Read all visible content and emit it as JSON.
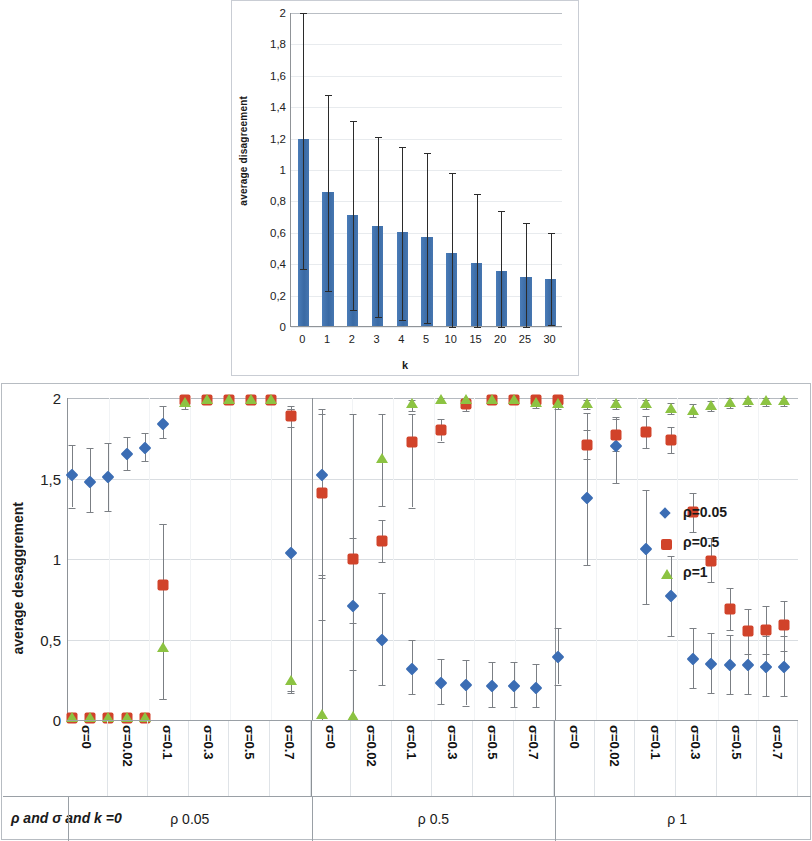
{
  "top": {
    "ylabel": "average disagreement",
    "xlabel": "k",
    "yticks": [
      "2",
      "1,8",
      "1,6",
      "1,4",
      "1,2",
      "1",
      "0,8",
      "0,6",
      "0,4",
      "0,2",
      "0"
    ]
  },
  "bottom": {
    "ylabel": "average desaggrement",
    "yticks": [
      "2",
      "1,5",
      "1",
      "0,5",
      "0"
    ],
    "footer_title": "ρ and σ and k =0",
    "legend": [
      {
        "label": "ρ=0.05",
        "marker": "diamond",
        "color": "#3b6db4"
      },
      {
        "label": "ρ=0.5",
        "marker": "square",
        "color": "#d1432a"
      },
      {
        "label": "ρ=1",
        "marker": "triangle",
        "color": "#8cc342"
      }
    ],
    "groups": [
      {
        "name": "ρ 0.05"
      },
      {
        "name": "ρ 0.5"
      },
      {
        "name": "ρ 1"
      }
    ],
    "sigma_labels": [
      "σ=0",
      "σ=0.02",
      "σ=0.1",
      "σ=0.3",
      "σ=0.5",
      "σ=0.7"
    ]
  },
  "chart_data": [
    {
      "type": "bar",
      "title": "",
      "xlabel": "k",
      "ylabel": "average disagreement",
      "ylim": [
        0,
        2
      ],
      "grid": true,
      "categories": [
        "0",
        "1",
        "2",
        "3",
        "4",
        "5",
        "10",
        "15",
        "20",
        "25",
        "30"
      ],
      "values": [
        1.19,
        0.855,
        0.71,
        0.64,
        0.6,
        0.57,
        0.465,
        0.4,
        0.35,
        0.315,
        0.3
      ],
      "error_low": [
        0.37,
        0.23,
        0.11,
        0.065,
        0.045,
        0.025,
        0.0,
        0.0,
        0.0,
        0.0,
        0.01
      ],
      "error_high": [
        2.0,
        1.48,
        1.31,
        1.21,
        1.15,
        1.11,
        0.98,
        0.85,
        0.74,
        0.66,
        0.6
      ],
      "bar_color": "#3d6fab",
      "error_color": "#2b2b2b"
    },
    {
      "type": "scatter",
      "title": "",
      "xlabel": "ρ and σ and k =0",
      "ylabel": "average desaggrement",
      "ylim": [
        0,
        2
      ],
      "grid": true,
      "legend_position": "right",
      "x_groups": [
        "ρ 0.05",
        "ρ 0.5",
        "ρ 1"
      ],
      "x": [
        "ρ 0.05 / σ=0",
        "ρ 0.05 / σ=0.02",
        "ρ 0.05 / σ=0.1",
        "ρ 0.05 / σ=0.3",
        "ρ 0.05 / σ=0.5",
        "ρ 0.05 / σ=0.7",
        "ρ 0.5 / σ=0",
        "ρ 0.5 / σ=0.02",
        "ρ 0.5 / σ=0.1",
        "ρ 0.5 / σ=0.3",
        "ρ 0.5 / σ=0.5",
        "ρ 0.5 / σ=0.7",
        "ρ 1 / σ=0",
        "ρ 1 / σ=0.02",
        "ρ 1 / σ=0.1",
        "ρ 1 / σ=0.3",
        "ρ 1 / σ=0.5",
        "ρ 1 / σ=0.7"
      ],
      "series": [
        {
          "name": "ρ=0.05",
          "marker": "diamond",
          "color": "#3b6db4",
          "points": [
            {
              "x": 0.1,
              "y": 1.52,
              "lo": 1.32,
              "hi": 1.71
            },
            {
              "x": 0.6,
              "y": 1.48,
              "lo": 1.29,
              "hi": 1.69
            },
            {
              "x": 1.1,
              "y": 1.51,
              "lo": 1.3,
              "hi": 1.72
            },
            {
              "x": 1.6,
              "y": 1.65,
              "lo": 1.55,
              "hi": 1.76
            },
            {
              "x": 2.1,
              "y": 1.69,
              "lo": 1.61,
              "hi": 1.78
            },
            {
              "x": 2.6,
              "y": 1.84,
              "lo": 1.75,
              "hi": 1.95
            },
            {
              "x": 6.1,
              "y": 1.04,
              "lo": 0.18,
              "hi": 1.93
            },
            {
              "x": 6.95,
              "y": 1.52,
              "lo": 0.88,
              "hi": 1.93
            },
            {
              "x": 7.8,
              "y": 0.71,
              "lo": 0.31,
              "hi": 1.13
            },
            {
              "x": 8.6,
              "y": 0.5,
              "lo": 0.22,
              "hi": 0.79
            },
            {
              "x": 9.4,
              "y": 0.32,
              "lo": 0.16,
              "hi": 0.5
            },
            {
              "x": 10.2,
              "y": 0.23,
              "lo": 0.1,
              "hi": 0.38
            },
            {
              "x": 10.9,
              "y": 0.22,
              "lo": 0.09,
              "hi": 0.37
            },
            {
              "x": 11.6,
              "y": 0.21,
              "lo": 0.08,
              "hi": 0.36
            },
            {
              "x": 12.2,
              "y": 0.21,
              "lo": 0.08,
              "hi": 0.36
            },
            {
              "x": 12.8,
              "y": 0.2,
              "lo": 0.08,
              "hi": 0.35
            },
            {
              "x": 13.4,
              "y": 0.39,
              "lo": 0.22,
              "hi": 0.57
            },
            {
              "x": 14.2,
              "y": 1.38,
              "lo": 0.96,
              "hi": 1.91
            },
            {
              "x": 15.0,
              "y": 1.7,
              "lo": 1.47,
              "hi": 1.88
            },
            {
              "x": 15.8,
              "y": 1.06,
              "lo": 0.72,
              "hi": 1.43
            },
            {
              "x": 16.5,
              "y": 0.77,
              "lo": 0.52,
              "hi": 1.02
            },
            {
              "x": 17.1,
              "y": 0.38,
              "lo": 0.2,
              "hi": 0.57
            },
            {
              "x": 17.6,
              "y": 0.35,
              "lo": 0.17,
              "hi": 0.54
            },
            {
              "x": 18.1,
              "y": 0.34,
              "lo": 0.16,
              "hi": 0.53
            },
            {
              "x": 18.6,
              "y": 0.34,
              "lo": 0.16,
              "hi": 0.53
            },
            {
              "x": 19.1,
              "y": 0.33,
              "lo": 0.15,
              "hi": 0.52
            },
            {
              "x": 19.6,
              "y": 0.33,
              "lo": 0.15,
              "hi": 0.52
            }
          ]
        },
        {
          "name": "ρ=0.5",
          "marker": "square",
          "color": "#d1432a",
          "points": [
            {
              "x": 0.1,
              "y": 0.01,
              "lo": 0.0,
              "hi": 0.02
            },
            {
              "x": 0.6,
              "y": 0.01,
              "lo": 0.0,
              "hi": 0.02
            },
            {
              "x": 1.1,
              "y": 0.01,
              "lo": 0.0,
              "hi": 0.02
            },
            {
              "x": 1.6,
              "y": 0.01,
              "lo": 0.0,
              "hi": 0.02
            },
            {
              "x": 2.1,
              "y": 0.01,
              "lo": 0.0,
              "hi": 0.02
            },
            {
              "x": 2.6,
              "y": 0.84,
              "lo": 0.13,
              "hi": 1.22
            },
            {
              "x": 3.2,
              "y": 1.99,
              "lo": 1.96,
              "hi": 2.0
            },
            {
              "x": 3.8,
              "y": 1.99,
              "lo": 1.96,
              "hi": 2.0
            },
            {
              "x": 4.4,
              "y": 1.99,
              "lo": 1.96,
              "hi": 2.0
            },
            {
              "x": 5.0,
              "y": 1.99,
              "lo": 1.96,
              "hi": 2.0
            },
            {
              "x": 5.55,
              "y": 1.99,
              "lo": 1.96,
              "hi": 2.0
            },
            {
              "x": 6.1,
              "y": 1.89,
              "lo": 1.82,
              "hi": 1.95
            },
            {
              "x": 6.95,
              "y": 1.41,
              "lo": 0.62,
              "hi": 1.9
            },
            {
              "x": 7.8,
              "y": 1.0,
              "lo": 0.02,
              "hi": 1.9
            },
            {
              "x": 8.6,
              "y": 1.11,
              "lo": 0.98,
              "hi": 1.24
            },
            {
              "x": 9.4,
              "y": 1.73,
              "lo": 1.32,
              "hi": 1.9
            },
            {
              "x": 10.2,
              "y": 1.8,
              "lo": 1.73,
              "hi": 1.87
            },
            {
              "x": 10.9,
              "y": 1.96,
              "lo": 1.92,
              "hi": 1.99
            },
            {
              "x": 11.6,
              "y": 1.99,
              "lo": 1.97,
              "hi": 2.0
            },
            {
              "x": 12.2,
              "y": 1.99,
              "lo": 1.97,
              "hi": 2.0
            },
            {
              "x": 12.8,
              "y": 1.99,
              "lo": 1.97,
              "hi": 2.0
            },
            {
              "x": 13.4,
              "y": 1.99,
              "lo": 1.97,
              "hi": 2.0
            },
            {
              "x": 14.2,
              "y": 1.71,
              "lo": 1.62,
              "hi": 1.8
            },
            {
              "x": 15.0,
              "y": 1.77,
              "lo": 1.67,
              "hi": 1.87
            },
            {
              "x": 15.8,
              "y": 1.79,
              "lo": 1.69,
              "hi": 1.89
            },
            {
              "x": 16.5,
              "y": 1.74,
              "lo": 1.66,
              "hi": 1.82
            },
            {
              "x": 17.1,
              "y": 1.29,
              "lo": 1.17,
              "hi": 1.41
            },
            {
              "x": 17.6,
              "y": 0.99,
              "lo": 0.86,
              "hi": 1.13
            },
            {
              "x": 18.1,
              "y": 0.69,
              "lo": 0.56,
              "hi": 0.82
            },
            {
              "x": 18.6,
              "y": 0.55,
              "lo": 0.41,
              "hi": 0.69
            },
            {
              "x": 19.1,
              "y": 0.56,
              "lo": 0.41,
              "hi": 0.71
            },
            {
              "x": 19.6,
              "y": 0.59,
              "lo": 0.43,
              "hi": 0.74
            }
          ]
        },
        {
          "name": "ρ=1",
          "marker": "triangle",
          "color": "#8cc342",
          "points": [
            {
              "x": 0.1,
              "y": 0.01,
              "lo": 0.0,
              "hi": 0.02
            },
            {
              "x": 0.6,
              "y": 0.01,
              "lo": 0.0,
              "hi": 0.02
            },
            {
              "x": 1.1,
              "y": 0.01,
              "lo": 0.0,
              "hi": 0.02
            },
            {
              "x": 1.6,
              "y": 0.01,
              "lo": 0.0,
              "hi": 0.02
            },
            {
              "x": 2.1,
              "y": 0.01,
              "lo": 0.0,
              "hi": 0.02
            },
            {
              "x": 2.6,
              "y": 0.45,
              "lo": 0.13,
              "hi": 1.22
            },
            {
              "x": 3.2,
              "y": 1.97,
              "lo": 1.93,
              "hi": 2.0
            },
            {
              "x": 3.8,
              "y": 1.99,
              "lo": 1.96,
              "hi": 2.0
            },
            {
              "x": 4.4,
              "y": 1.99,
              "lo": 1.96,
              "hi": 2.0
            },
            {
              "x": 5.0,
              "y": 1.99,
              "lo": 1.96,
              "hi": 2.0
            },
            {
              "x": 5.55,
              "y": 1.99,
              "lo": 1.96,
              "hi": 2.0
            },
            {
              "x": 6.1,
              "y": 0.24,
              "lo": 0.17,
              "hi": 1.93
            },
            {
              "x": 6.95,
              "y": 0.03,
              "lo": 0.0,
              "hi": 0.9
            },
            {
              "x": 7.8,
              "y": 0.02,
              "lo": 0.0,
              "hi": 0.6
            },
            {
              "x": 8.6,
              "y": 1.62,
              "lo": 1.33,
              "hi": 1.9
            },
            {
              "x": 9.4,
              "y": 1.96,
              "lo": 1.92,
              "hi": 1.99
            },
            {
              "x": 10.2,
              "y": 1.99,
              "lo": 1.97,
              "hi": 2.0
            },
            {
              "x": 10.9,
              "y": 1.99,
              "lo": 1.97,
              "hi": 2.0
            },
            {
              "x": 11.6,
              "y": 1.99,
              "lo": 1.97,
              "hi": 2.0
            },
            {
              "x": 12.2,
              "y": 1.99,
              "lo": 1.97,
              "hi": 2.0
            },
            {
              "x": 12.8,
              "y": 1.97,
              "lo": 1.94,
              "hi": 2.0
            },
            {
              "x": 13.4,
              "y": 1.96,
              "lo": 1.93,
              "hi": 1.99
            },
            {
              "x": 14.2,
              "y": 1.96,
              "lo": 1.93,
              "hi": 1.99
            },
            {
              "x": 15.0,
              "y": 1.96,
              "lo": 1.93,
              "hi": 1.99
            },
            {
              "x": 15.8,
              "y": 1.96,
              "lo": 1.93,
              "hi": 1.99
            },
            {
              "x": 16.5,
              "y": 1.93,
              "lo": 1.9,
              "hi": 1.97
            },
            {
              "x": 17.1,
              "y": 1.92,
              "lo": 1.88,
              "hi": 1.96
            },
            {
              "x": 17.6,
              "y": 1.95,
              "lo": 1.92,
              "hi": 1.98
            },
            {
              "x": 18.1,
              "y": 1.97,
              "lo": 1.94,
              "hi": 2.0
            },
            {
              "x": 18.6,
              "y": 1.98,
              "lo": 1.95,
              "hi": 2.0
            },
            {
              "x": 19.1,
              "y": 1.98,
              "lo": 1.95,
              "hi": 2.0
            },
            {
              "x": 19.6,
              "y": 1.98,
              "lo": 1.95,
              "hi": 2.0
            }
          ]
        }
      ]
    }
  ]
}
